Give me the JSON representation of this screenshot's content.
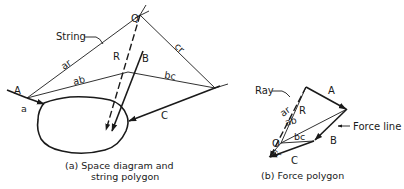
{
  "space_diagram": {
    "caption_line1": "(a) Space diagram and",
    "caption_line2": "string polygon",
    "labels": {
      "string": "String",
      "Q": "Q",
      "ar": "ar",
      "ab": "ab",
      "bc": "bc",
      "cr": "cr",
      "R": "R",
      "B": "B",
      "A": "A",
      "a": "a",
      "C": "C"
    }
  },
  "force_polygon": {
    "caption": "(b) Force polygon",
    "labels": {
      "ray": "Ray",
      "A": "A",
      "force_line": "Force line",
      "R": "R",
      "ar": "ar",
      "ab": "ab",
      "O": "O",
      "bc": "bc",
      "B": "B",
      "cr": "cr",
      "C": "C"
    }
  }
}
